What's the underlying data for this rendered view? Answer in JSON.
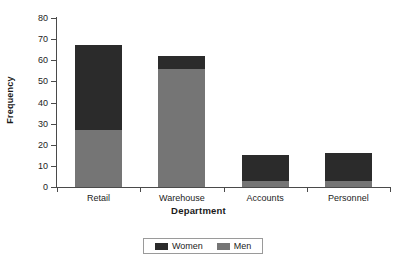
{
  "chart_data": {
    "type": "bar",
    "subtype": "stacked-bar",
    "title": "",
    "xlabel": "Department",
    "ylabel": "Frequency",
    "categories": [
      "Retail",
      "Warehouse",
      "Accounts",
      "Personnel"
    ],
    "series": [
      {
        "name": "Women",
        "values": [
          40,
          6,
          12,
          13
        ],
        "color": "#2b2b2b"
      },
      {
        "name": "Men",
        "values": [
          27,
          56,
          3,
          3
        ],
        "color": "#757575"
      }
    ],
    "stack_order_bottom_to_top": [
      "Men",
      "Women"
    ],
    "totals": [
      67,
      62,
      15,
      16
    ],
    "ylim": [
      0,
      80
    ],
    "yticks": [
      0,
      10,
      20,
      30,
      40,
      50,
      60,
      70,
      80
    ],
    "ytick_labels": [
      "0",
      "10",
      "20",
      "30",
      "40",
      "50",
      "60",
      "70",
      "80"
    ],
    "grid": false,
    "legend_position": "bottom",
    "legend_entries": [
      "Women",
      "Men"
    ]
  },
  "axes": {
    "y_title": "Frequency",
    "x_title": "Department"
  },
  "colors": {
    "women": "#2b2b2b",
    "men": "#757575",
    "axis": "#4a4a4a",
    "background": "#ffffff",
    "legend_border": "#9a9a9a"
  }
}
